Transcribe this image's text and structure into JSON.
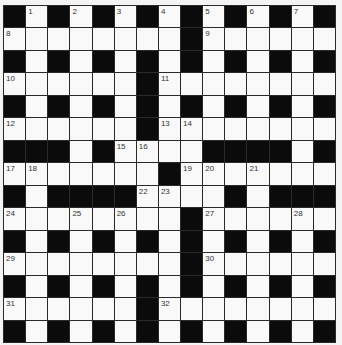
{
  "puzzle": {
    "rows": 15,
    "cols": 15,
    "colors": {
      "block": "#0b0b0b",
      "cell": "#f9f9f9",
      "gridline": "#2a2a2a",
      "background": "#f4f4f4"
    },
    "layout": [
      "#.#.#.#.#.#.#.#",
      "........#......",
      "#.#.#.#.#.#.#.#",
      "......#........",
      "#.#.#.#.#.#.#.#",
      "......#........",
      "###.#....####.#",
      ".......#.......",
      "#.####....#.###",
      "........#......",
      "#.#.#.#.#.#.#.#",
      "........#......",
      "#.#.#.#.#.#.#.#",
      "......#........",
      "#.#.#.#.#.#.#.#"
    ],
    "numbers": [
      {
        "row": 0,
        "col": 1,
        "n": "1"
      },
      {
        "row": 0,
        "col": 3,
        "n": "2"
      },
      {
        "row": 0,
        "col": 5,
        "n": "3"
      },
      {
        "row": 0,
        "col": 7,
        "n": "4"
      },
      {
        "row": 0,
        "col": 9,
        "n": "5"
      },
      {
        "row": 0,
        "col": 11,
        "n": "6"
      },
      {
        "row": 0,
        "col": 13,
        "n": "7"
      },
      {
        "row": 1,
        "col": 0,
        "n": "8"
      },
      {
        "row": 1,
        "col": 9,
        "n": "9"
      },
      {
        "row": 3,
        "col": 0,
        "n": "10"
      },
      {
        "row": 3,
        "col": 7,
        "n": "11"
      },
      {
        "row": 5,
        "col": 0,
        "n": "12"
      },
      {
        "row": 5,
        "col": 7,
        "n": "13"
      },
      {
        "row": 5,
        "col": 8,
        "n": "14"
      },
      {
        "row": 6,
        "col": 5,
        "n": "15"
      },
      {
        "row": 6,
        "col": 6,
        "n": "16"
      },
      {
        "row": 7,
        "col": 0,
        "n": "17"
      },
      {
        "row": 7,
        "col": 1,
        "n": "18"
      },
      {
        "row": 7,
        "col": 8,
        "n": "19"
      },
      {
        "row": 7,
        "col": 9,
        "n": "20"
      },
      {
        "row": 7,
        "col": 11,
        "n": "21"
      },
      {
        "row": 8,
        "col": 6,
        "n": "22"
      },
      {
        "row": 8,
        "col": 7,
        "n": "23"
      },
      {
        "row": 9,
        "col": 0,
        "n": "24"
      },
      {
        "row": 9,
        "col": 3,
        "n": "25"
      },
      {
        "row": 9,
        "col": 5,
        "n": "26"
      },
      {
        "row": 9,
        "col": 9,
        "n": "27"
      },
      {
        "row": 9,
        "col": 13,
        "n": "28"
      },
      {
        "row": 11,
        "col": 0,
        "n": "29"
      },
      {
        "row": 11,
        "col": 9,
        "n": "30"
      },
      {
        "row": 13,
        "col": 0,
        "n": "31"
      },
      {
        "row": 13,
        "col": 7,
        "n": "32"
      }
    ],
    "entries": {}
  }
}
